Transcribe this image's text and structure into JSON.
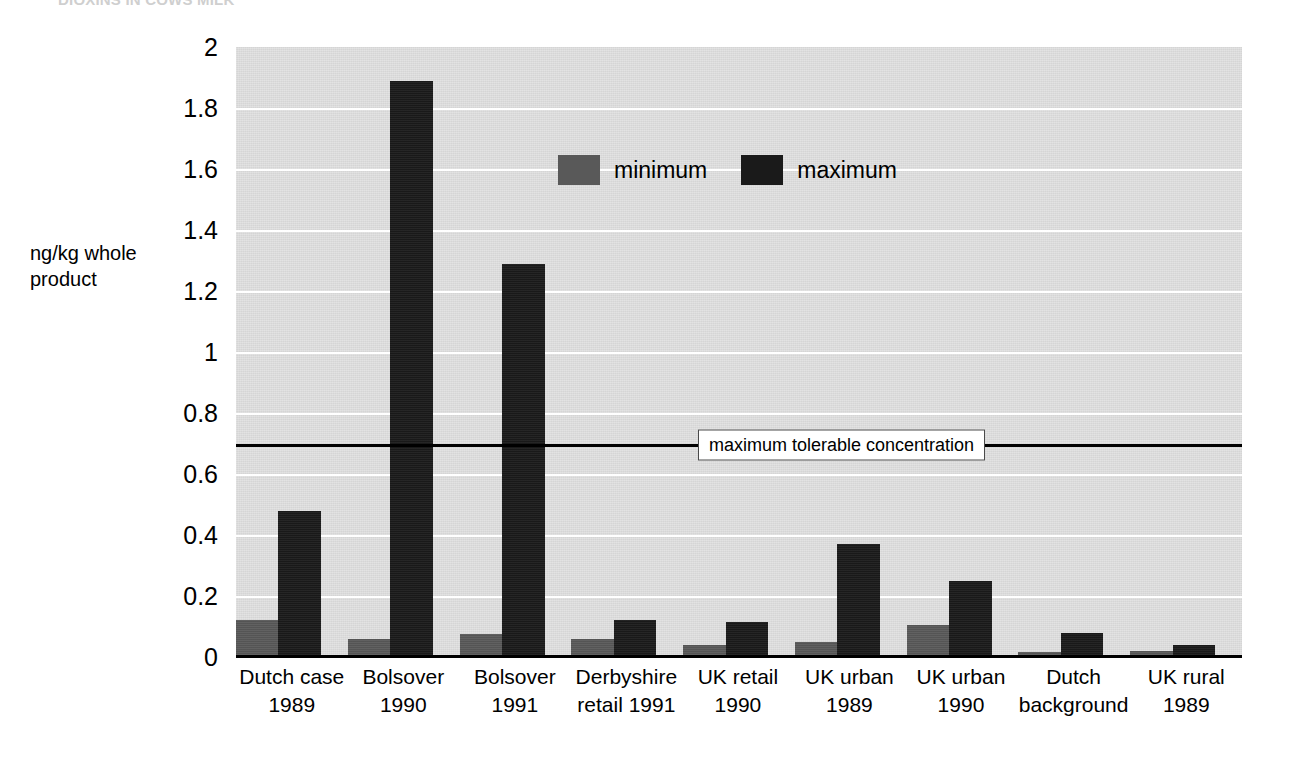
{
  "clipped_title": "DIOXINS IN COWS MILK",
  "chart_data": {
    "type": "bar",
    "title": "",
    "subtitle": "",
    "xlabel": "",
    "ylabel": "ng/kg whole\nproduct",
    "ylim": [
      0,
      2
    ],
    "ytick_labels": [
      "2",
      "1.8",
      "1.6",
      "1.4",
      "1.2",
      "1",
      "0.8",
      "0.6",
      "0.4",
      "0.2",
      "0"
    ],
    "ytick_values": [
      2,
      1.8,
      1.6,
      1.4,
      1.2,
      1,
      0.8,
      0.6,
      0.4,
      0.2,
      0
    ],
    "grid": true,
    "legend_position": "upper-center",
    "categories": [
      "Dutch case\n1989",
      "Bolsover\n1990",
      "Bolsover\n1991",
      "Derbyshire\nretail 1991",
      "UK retail\n1990",
      "UK urban\n1989",
      "UK urban\n1990",
      "Dutch\nbackground",
      "UK rural\n1989"
    ],
    "series": [
      {
        "name": "minimum",
        "color": "#595959",
        "values": [
          0.12,
          0.06,
          0.075,
          0.06,
          0.04,
          0.05,
          0.105,
          0.015,
          0.02
        ]
      },
      {
        "name": "maximum",
        "color": "#1a1a1a",
        "values": [
          0.48,
          1.89,
          1.29,
          0.12,
          0.115,
          0.37,
          0.25,
          0.08,
          0.04
        ]
      }
    ],
    "annotations": [
      {
        "kind": "threshold-line",
        "label": "maximum tolerable concentration",
        "value": 0.7,
        "color": "#000000"
      }
    ]
  }
}
